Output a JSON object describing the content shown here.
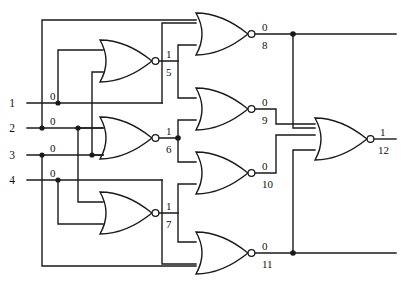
{
  "diagram": {
    "type": "nor-gate-circuit",
    "stroke_color": "#1a1a1a",
    "text_color": "#111111",
    "background": "#ffffff"
  },
  "inputs": [
    {
      "name": "input-1",
      "label": "1",
      "value": "0",
      "y": 103
    },
    {
      "name": "input-2",
      "label": "2",
      "value": "0",
      "y": 128
    },
    {
      "name": "input-3",
      "label": "3",
      "value": "0",
      "y": 155
    },
    {
      "name": "input-4",
      "label": "4",
      "value": "0",
      "y": 180
    }
  ],
  "gates": [
    {
      "id": "5",
      "type": "NOR",
      "label": "5",
      "value": "1",
      "inputs": 2,
      "x": 100,
      "y": 40,
      "w": 62,
      "h": 42
    },
    {
      "id": "6",
      "type": "NOR",
      "label": "6",
      "value": "1",
      "inputs": 2,
      "x": 100,
      "y": 117,
      "w": 62,
      "h": 42
    },
    {
      "id": "7",
      "type": "NOR",
      "label": "7",
      "value": "1",
      "inputs": 2,
      "x": 100,
      "y": 192,
      "w": 62,
      "h": 42
    },
    {
      "id": "8",
      "type": "NOR",
      "label": "8",
      "value": "0",
      "inputs": 2,
      "x": 196,
      "y": 13,
      "w": 58,
      "h": 42
    },
    {
      "id": "9",
      "type": "NOR",
      "label": "9",
      "value": "0",
      "inputs": 2,
      "x": 196,
      "y": 88,
      "w": 58,
      "h": 42
    },
    {
      "id": "10",
      "type": "NOR",
      "label": "10",
      "value": "0",
      "inputs": 2,
      "x": 196,
      "y": 152,
      "w": 58,
      "h": 42
    },
    {
      "id": "11",
      "type": "NOR",
      "label": "11",
      "value": "0",
      "inputs": 2,
      "x": 196,
      "y": 232,
      "w": 58,
      "h": 42
    },
    {
      "id": "12",
      "type": "NOR",
      "label": "12",
      "value": "1",
      "inputs": 4,
      "x": 315,
      "y": 118,
      "w": 58,
      "h": 42
    }
  ],
  "outputs": [
    {
      "name": "output-12",
      "label": "12",
      "value": "1"
    }
  ],
  "signal_values": {
    "in1": "0",
    "in2": "0",
    "in3": "0",
    "in4": "0",
    "g5": "1",
    "g6": "1",
    "g7": "1",
    "g8": "0",
    "g9": "0",
    "g10": "0",
    "g11": "0",
    "g12": "1"
  }
}
